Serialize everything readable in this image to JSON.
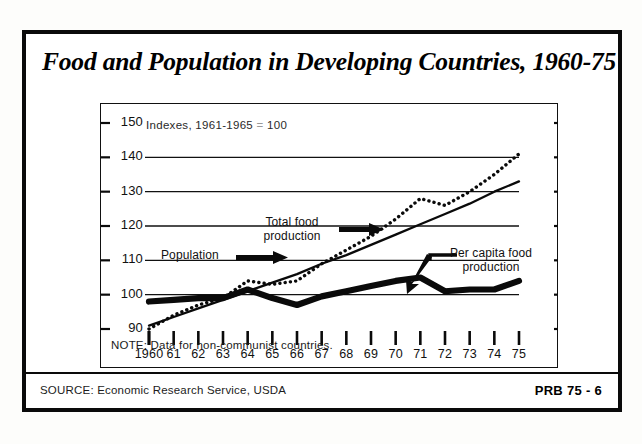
{
  "title": "Food and Population in Developing Countries, 1960-75",
  "subtitle_prefix": "Indexes, 1961-1965",
  "subtitle_eq": "=",
  "subtitle_value": "100",
  "note": "NOTE: Data for non-communist countries.",
  "source": "SOURCE: Economic Research Service, USDA",
  "publication_code": "PRB 75 - 6",
  "annotations": {
    "total_food_line1": "Total food",
    "total_food_line2": "production",
    "population": "Population",
    "per_capita_line1": "Per capita food",
    "per_capita_line2": "production"
  },
  "colors": {
    "ink": "#0a0a0a",
    "paper": "#ffffff",
    "gridline": "#111111"
  },
  "chart_data": {
    "type": "line",
    "title": "Food and Population in Developing Countries, 1960-75",
    "subtitle": "Indexes, 1961-1965 = 100",
    "xlabel": "",
    "ylabel": "Index (1961-1965 = 100)",
    "x": [
      1960,
      1961,
      1962,
      1963,
      1964,
      1965,
      1966,
      1967,
      1968,
      1969,
      1970,
      1971,
      1972,
      1973,
      1974,
      1975
    ],
    "xtick_labels": [
      "1960",
      "61",
      "62",
      "63",
      "64",
      "65",
      "66",
      "67",
      "68",
      "69",
      "70",
      "71",
      "72",
      "73",
      "74",
      "75"
    ],
    "yticks": [
      90,
      100,
      110,
      120,
      130,
      140,
      150
    ],
    "ylim": [
      88,
      152
    ],
    "gridlines": [
      100,
      110,
      120,
      130,
      140
    ],
    "grid": true,
    "legend": "annotated-inline",
    "series": [
      {
        "name": "Total food production",
        "style": "dotted",
        "values": [
          90,
          94,
          97,
          99,
          104,
          103,
          104,
          109,
          113,
          117,
          122,
          128,
          126,
          130,
          135,
          141
        ]
      },
      {
        "name": "Population",
        "style": "solid-thin",
        "values": [
          91,
          93.5,
          96,
          98.5,
          101,
          103.5,
          106,
          109,
          111.5,
          114.5,
          117.5,
          120.5,
          123.5,
          126.5,
          130,
          133
        ]
      },
      {
        "name": "Per capita food production",
        "style": "solid-thick",
        "values": [
          98,
          98.5,
          99,
          99,
          101.5,
          99,
          97,
          99.5,
          101,
          102.5,
          104,
          105,
          101,
          101.5,
          101.5,
          104
        ]
      }
    ]
  }
}
